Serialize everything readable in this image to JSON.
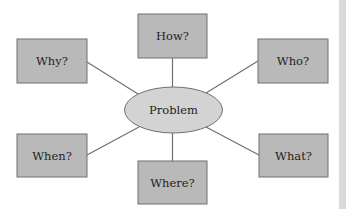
{
  "diagram": {
    "center": {
      "label": "Problem"
    },
    "nodes": [
      {
        "id": "how",
        "label": "How?"
      },
      {
        "id": "why",
        "label": "Why?"
      },
      {
        "id": "who",
        "label": "Who?"
      },
      {
        "id": "when",
        "label": "When?"
      },
      {
        "id": "what",
        "label": "What?"
      },
      {
        "id": "where",
        "label": "Where?"
      }
    ],
    "colors": {
      "box_fill": "#b9b9b9",
      "ellipse_fill": "#d3d3d3",
      "stroke": "#707070",
      "text": "#1e1e1e"
    }
  }
}
